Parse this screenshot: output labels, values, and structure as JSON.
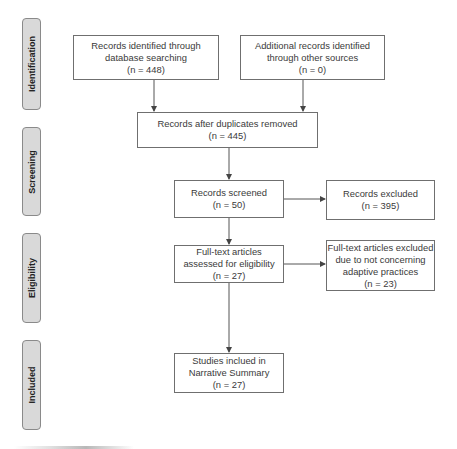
{
  "phases": [
    {
      "label": "Identification"
    },
    {
      "label": "Screening"
    },
    {
      "label": "Eligibility"
    },
    {
      "label": "Included"
    }
  ],
  "boxes": {
    "database_search": {
      "lines": [
        "Records identified through",
        "database searching",
        "(n = 448)"
      ]
    },
    "other_sources": {
      "lines": [
        "Additional records identified",
        "through other sources",
        "(n = 0)"
      ]
    },
    "after_duplicates": {
      "lines": [
        "Records after duplicates removed",
        "(n = 445)"
      ]
    },
    "screened": {
      "lines": [
        "Records screened",
        "(n = 50)"
      ]
    },
    "excluded": {
      "lines": [
        "Records excluded",
        "(n = 395)"
      ]
    },
    "fulltext_assessed": {
      "lines": [
        "Full-text articles",
        "assessed for eligibility",
        "(n = 27)"
      ]
    },
    "fulltext_excluded": {
      "lines": [
        "Full-text articles excluded",
        "due to not concerning",
        "adaptive practices",
        "(n = 23)"
      ]
    },
    "included": {
      "lines": [
        "Studies inclued in",
        "Narrative Summary",
        "(n = 27)"
      ]
    }
  },
  "colors": {
    "phase_fill": "#d9d9d9",
    "border": "#6f6f6f",
    "line": "#555555"
  }
}
